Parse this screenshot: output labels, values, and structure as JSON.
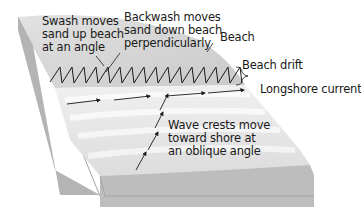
{
  "labels": {
    "swash": [
      "Swash moves",
      "sand up beach",
      "at an angle"
    ],
    "backwash": [
      "Backwash moves",
      "sand down beach",
      "perpendicularly"
    ],
    "beach": "Beach",
    "beach_drift": "Beach drift",
    "longshore_current": "Longshore current",
    "wave_crests": [
      "Wave crests move",
      "toward shore at",
      "an oblique angle"
    ]
  },
  "colors": {
    "sand": "#d8d8d8",
    "sand_dark": "#c4c4c4",
    "water": "#e6e6e6",
    "wave_highlight": "#f7f7f7",
    "block_side": "#b9b9b9",
    "block_front": "#a8a8a8",
    "arrow": "#1a1a1a"
  }
}
